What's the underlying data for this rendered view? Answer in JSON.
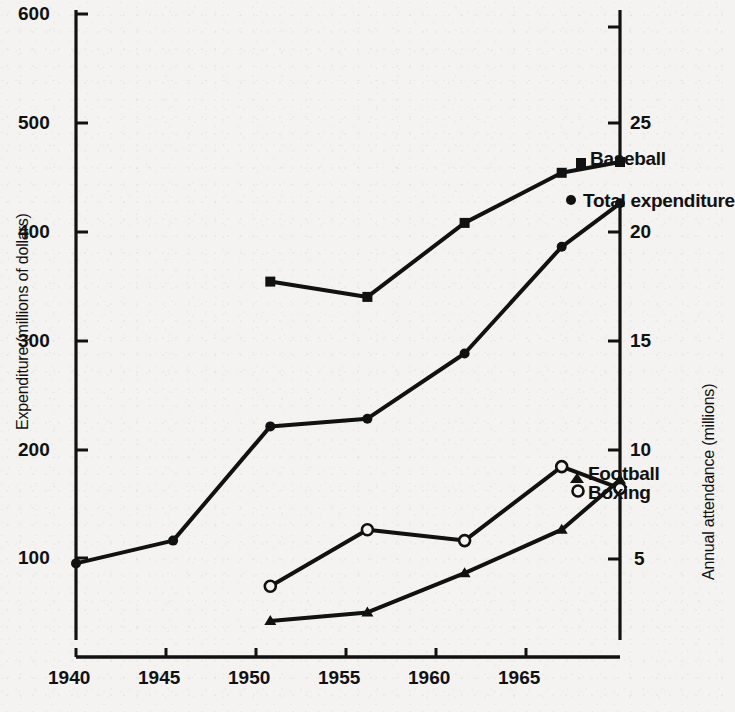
{
  "figure": {
    "background_color": "#f4f3f1",
    "ink_color": "#111111"
  },
  "axes": {
    "left": {
      "title": "Expenditure (millions of dollars)",
      "ticks": [
        "600",
        "500",
        "400",
        "300",
        "200",
        "100"
      ],
      "tick_values": [
        600,
        500,
        400,
        300,
        200,
        100
      ],
      "range": [
        0,
        600
      ]
    },
    "right": {
      "title": "Annual attendance (millions)",
      "ticks": [
        "25",
        "20",
        "15",
        "10",
        "5"
      ],
      "tick_values": [
        25,
        20,
        15,
        10,
        5
      ],
      "range": [
        0,
        30
      ]
    },
    "bottom": {
      "title": "",
      "ticks": [
        "1940",
        "1945",
        "1950",
        "1955",
        "1960",
        "1965"
      ],
      "tick_values": [
        1940,
        1945,
        1950,
        1955,
        1960,
        1965
      ],
      "range": [
        1940,
        1968
      ]
    }
  },
  "series_labels": {
    "baseball": "Baseball",
    "total_expenditure": "Total expenditure",
    "football": "Football",
    "boxing": "Boxing"
  },
  "chart_data": {
    "type": "line",
    "title": "",
    "xlabel": "",
    "ylabel": "Expenditure (millions of dollars)",
    "y2label": "Annual attendance (millions)",
    "xlim": [
      1940,
      1968
    ],
    "ylim": [
      0,
      600
    ],
    "y2lim": [
      0,
      30
    ],
    "grid": false,
    "legend": "inline-right-of-line-ends",
    "series": [
      {
        "name": "Total expenditure",
        "axis": "left",
        "unit": "millions of dollars",
        "marker": "filled-circle",
        "x": [
          1940,
          1945,
          1950,
          1955,
          1960,
          1965,
          1968
        ],
        "values": [
          95,
          116,
          221,
          228,
          288,
          386,
          426
        ]
      },
      {
        "name": "Baseball",
        "axis": "right",
        "unit": "millions (annual attendance)",
        "marker": "filled-square",
        "x": [
          1950,
          1955,
          1960,
          1965,
          1968
        ],
        "values": [
          17.7,
          17.0,
          20.4,
          22.7,
          23.2
        ],
        "left_axis_equivalent": [
          353,
          340,
          407,
          453,
          463
        ]
      },
      {
        "name": "Boxing",
        "axis": "right",
        "unit": "millions (annual attendance)",
        "marker": "open-circle",
        "x": [
          1950,
          1955,
          1960,
          1965,
          1968
        ],
        "values": [
          3.7,
          6.3,
          5.8,
          9.2,
          8.2
        ],
        "left_axis_equivalent": [
          73,
          126,
          116,
          185,
          163
        ]
      },
      {
        "name": "Football",
        "axis": "right",
        "unit": "millions (annual attendance)",
        "marker": "filled-triangle",
        "x": [
          1950,
          1955,
          1960,
          1965,
          1968
        ],
        "values": [
          2.1,
          2.5,
          4.3,
          6.3,
          8.6
        ],
        "left_axis_equivalent": [
          42,
          50,
          86,
          127,
          171
        ]
      }
    ]
  }
}
